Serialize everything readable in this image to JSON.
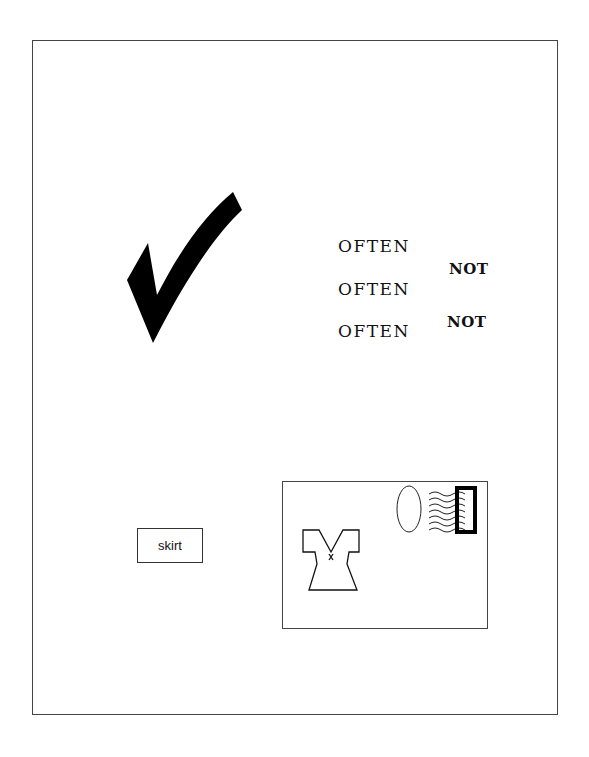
{
  "figure": {
    "checkmark": {
      "icon": "checkmark-icon",
      "color": "#000000"
    },
    "word_list": {
      "often": [
        "OFTEN",
        "OFTEN",
        "OFTEN"
      ],
      "not": [
        "NOT",
        "NOT"
      ]
    },
    "skirt_label": "skirt",
    "postcard": {
      "icons": [
        "dress-icon",
        "oval-postmark-icon",
        "wavy-cancel-lines-icon",
        "stamp-icon"
      ]
    }
  }
}
